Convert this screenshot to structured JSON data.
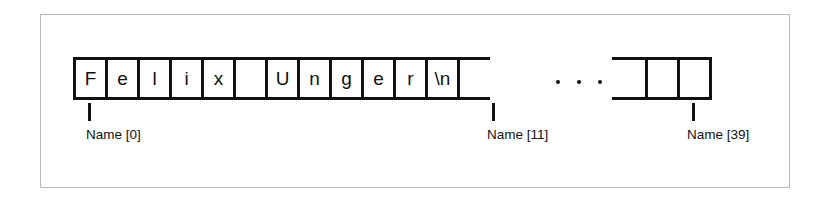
{
  "figure": {
    "kind": "array-memory-diagram",
    "colors": {
      "ink": "#111111",
      "frame": "#b9b9b9",
      "background": "#ffffff"
    },
    "array": {
      "main_cells": [
        {
          "value": "F"
        },
        {
          "value": "e"
        },
        {
          "value": "l"
        },
        {
          "value": "i"
        },
        {
          "value": "x"
        },
        {
          "value": ""
        },
        {
          "value": "U"
        },
        {
          "value": "n"
        },
        {
          "value": "g"
        },
        {
          "value": "e"
        },
        {
          "value": "r"
        },
        {
          "value": "\\n"
        },
        {
          "value": ""
        }
      ],
      "ellipsis": "...",
      "tail_cells": [
        {
          "value": ""
        },
        {
          "value": ""
        },
        {
          "value": ""
        }
      ]
    },
    "annotations": [
      {
        "label": "Name [0]",
        "index": 0,
        "tick_x": 88,
        "label_x": 86
      },
      {
        "label": "Name [11]",
        "index": 11,
        "tick_x": 492,
        "label_x": 487
      },
      {
        "label": "Name [39]",
        "index": 39,
        "tick_x": 692,
        "label_x": 687
      }
    ]
  }
}
